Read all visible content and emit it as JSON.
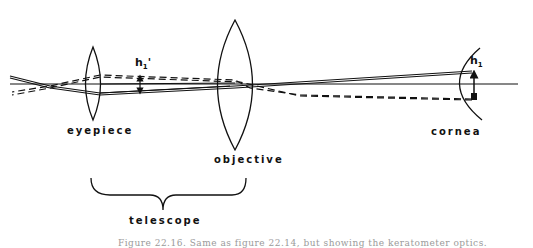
{
  "labels": {
    "eyepiece": "eyepiece",
    "objective": "objective",
    "cornea": "cornea",
    "telescope": "telescope"
  },
  "symbols": {
    "image_height": "h",
    "image_height_sub": "1",
    "image_height_prime": "'",
    "object_height": "h",
    "object_height_sub": "1"
  },
  "caption": "Figure 22.16. Same as figure 22.14, but showing the keratometer optics."
}
